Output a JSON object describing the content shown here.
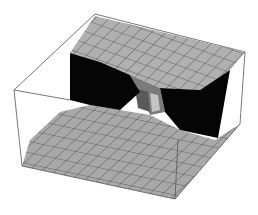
{
  "figure": {
    "type": "3d-surface-plot",
    "width": 258,
    "height": 215,
    "background": "#ffffff"
  },
  "colors": {
    "box_edge": "#555555",
    "surface_light": "#b4b4b4",
    "surface_mid": "#9a9a9a",
    "surface_dark": "#6e6e6e",
    "shadow": "#050505",
    "mesh_line": "#3a3a3a"
  },
  "box": {
    "back_top_left": [
      14,
      90
    ],
    "back_top_far": [
      95,
      14
    ],
    "back_top_right": [
      245,
      52
    ],
    "front_bottom_left": [
      22,
      166
    ],
    "front_bottom_right": [
      175,
      199
    ],
    "right_bottom": [
      240,
      124
    ]
  },
  "surface": {
    "description": "Surface high in back half, low in front half, with a step/saddle through the center and dark shadowed cliffs on left and right",
    "grid_divisions": 14,
    "upper_plateau": [
      [
        70,
        53
      ],
      [
        95,
        16
      ],
      [
        245,
        52
      ],
      [
        230,
        70
      ],
      [
        200,
        90
      ],
      [
        160,
        88
      ],
      [
        130,
        75
      ],
      [
        100,
        62
      ]
    ],
    "lower_plateau": [
      [
        22,
        166
      ],
      [
        175,
        199
      ],
      [
        240,
        124
      ],
      [
        215,
        140
      ],
      [
        180,
        130
      ],
      [
        150,
        115
      ],
      [
        120,
        110
      ],
      [
        90,
        105
      ],
      [
        60,
        112
      ],
      [
        30,
        140
      ]
    ],
    "left_shadow": [
      [
        70,
        53
      ],
      [
        100,
        62
      ],
      [
        130,
        75
      ],
      [
        140,
        92
      ],
      [
        120,
        110
      ],
      [
        90,
        105
      ],
      [
        70,
        100
      ]
    ],
    "right_shadow": [
      [
        160,
        88
      ],
      [
        200,
        90
      ],
      [
        230,
        70
      ],
      [
        218,
        138
      ],
      [
        180,
        130
      ],
      [
        165,
        112
      ]
    ],
    "center_step": [
      [
        130,
        75
      ],
      [
        160,
        88
      ],
      [
        165,
        112
      ],
      [
        150,
        115
      ],
      [
        140,
        92
      ]
    ]
  }
}
